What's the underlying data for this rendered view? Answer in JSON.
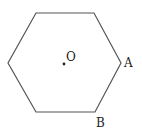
{
  "diagram": {
    "shape": "regular hexagon",
    "stroke_color": "#555555",
    "vertices": [
      [
        36,
        13
      ],
      [
        94,
        13
      ],
      [
        121,
        63
      ],
      [
        95,
        112
      ],
      [
        36,
        112
      ],
      [
        8,
        63
      ]
    ],
    "center": {
      "x": 64,
      "y": 64,
      "label": "O"
    },
    "labels": [
      {
        "text": "A",
        "x": 124,
        "y": 67
      },
      {
        "text": "B",
        "x": 96,
        "y": 127
      }
    ]
  }
}
